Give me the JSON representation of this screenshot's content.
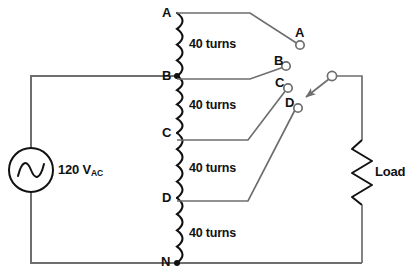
{
  "diagram": {
    "background_color": "#ffffff",
    "wire_color": "#6e6e6e",
    "coil_color": "#111111",
    "label_color": "#111111"
  },
  "source": {
    "name": "ac-voltage-source",
    "symbol": "sine-wave",
    "value": "120 V",
    "unit_subscript": "AC",
    "full_label": "120 VAC"
  },
  "load": {
    "name": "load-resistor",
    "symbol": "zigzag-resistor",
    "label": "Load"
  },
  "winding": {
    "name": "tapped-autotransformer-winding",
    "segments": [
      {
        "id": "seg-a-b",
        "from": "A",
        "to": "B",
        "turns_label": "40 turns",
        "turns": 40
      },
      {
        "id": "seg-b-c",
        "from": "B",
        "to": "C",
        "turns_label": "40 turns",
        "turns": 40
      },
      {
        "id": "seg-c-d",
        "from": "C",
        "to": "D",
        "turns_label": "40 turns",
        "turns": 40
      },
      {
        "id": "seg-d-n",
        "from": "D",
        "to": "N",
        "turns_label": "40 turns",
        "turns": 40
      }
    ],
    "total_turns": 160
  },
  "taps": [
    {
      "id": "tap-a",
      "label": "A"
    },
    {
      "id": "tap-b",
      "label": "B"
    },
    {
      "id": "tap-c",
      "label": "C"
    },
    {
      "id": "tap-d",
      "label": "D"
    },
    {
      "id": "tap-n",
      "label": "N"
    }
  ],
  "terminals": [
    {
      "id": "terminal-a",
      "label": "A"
    },
    {
      "id": "terminal-b",
      "label": "B"
    },
    {
      "id": "terminal-c",
      "label": "C"
    },
    {
      "id": "terminal-d",
      "label": "D"
    }
  ],
  "selector_switch": {
    "name": "rotary-selector-switch",
    "pointer": "arrow",
    "selected_terminal": "D"
  }
}
